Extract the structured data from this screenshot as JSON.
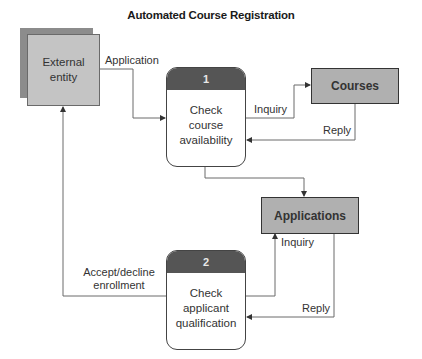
{
  "title": "Automated Course Registration",
  "external_entity": {
    "line1": "External",
    "line2": "entity"
  },
  "processes": [
    {
      "number": "1",
      "line1": "Check",
      "line2": "course",
      "line3": "availability"
    },
    {
      "number": "2",
      "line1": "Check",
      "line2": "applicant",
      "line3": "qualification"
    }
  ],
  "data_stores": [
    {
      "label": "Courses"
    },
    {
      "label": "Applications"
    }
  ],
  "flows": {
    "application": "Application",
    "inquiry_courses": "Inquiry",
    "reply_courses": "Reply",
    "inquiry_applications": "Inquiry",
    "reply_applications": "Reply",
    "accept_decline_line1": "Accept/decline",
    "accept_decline_line2": "enrollment"
  },
  "colors": {
    "entity_fill": "#c4c4c4",
    "entity_shadow": "#8c8c8c",
    "process_header": "#555555",
    "store_fill": "#b0b0b0",
    "line": "#666666"
  }
}
